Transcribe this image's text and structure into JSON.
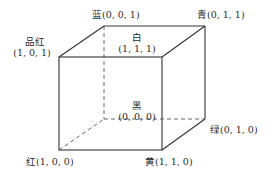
{
  "diagram": {
    "vertices": [
      {
        "id": "blue",
        "name": "蓝",
        "coords": "(0, 0, 1)"
      },
      {
        "id": "cyan",
        "name": "青",
        "coords": "(0, 1, 1)"
      },
      {
        "id": "magenta",
        "name": "品红",
        "coords": "(1, 0, 1)"
      },
      {
        "id": "white",
        "name": "白",
        "coords": "(1, 1, 1)"
      },
      {
        "id": "black",
        "name": "黑",
        "coords": "(0, 0, 0)"
      },
      {
        "id": "green",
        "name": "绿",
        "coords": "(0, 1, 0)"
      },
      {
        "id": "red",
        "name": "红",
        "coords": "(1, 0, 0)"
      },
      {
        "id": "yellow",
        "name": "黄",
        "coords": "(1, 1, 0)"
      }
    ],
    "labels": {
      "blue": "蓝(0, 0, 1)",
      "cyan": "青(0, 1, 1)",
      "magenta_name": "品红",
      "magenta_coords": "(1, 0, 1)",
      "white_name": "白",
      "white_coords": "(1, 1, 1)",
      "black_name": "黑",
      "black_coords": "(0, 0, 0)",
      "green": "绿(0, 1, 0)",
      "red": "红(1, 0, 0)",
      "yellow": "黄(1, 1, 0)"
    },
    "line_color": "#333333",
    "hidden_edge_style": "dashed"
  }
}
